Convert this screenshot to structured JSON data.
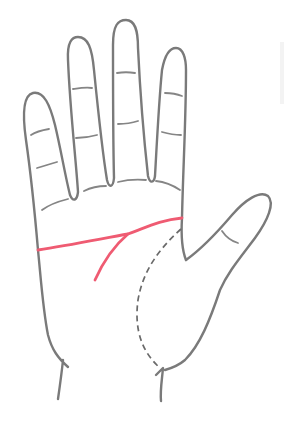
{
  "figure": {
    "background": "#ffffff",
    "outline_color": "#7a7a7a",
    "highlight_color": "#ef5b72",
    "dashed_line_color": "#6a6a6a"
  },
  "lines": [
    {
      "id": "heart-line",
      "style": "solid",
      "color": "#ef5b72",
      "description": "horizontal line across palm from pinky side to index base"
    },
    {
      "id": "head-line-branch",
      "style": "solid",
      "color": "#ef5b72",
      "description": "branch curving down from heart line"
    },
    {
      "id": "life-line",
      "style": "dashed",
      "color": "#6a6a6a",
      "description": "curve around thumb mount"
    }
  ],
  "fingers": [
    "pinky",
    "ring",
    "middle",
    "index",
    "thumb"
  ]
}
